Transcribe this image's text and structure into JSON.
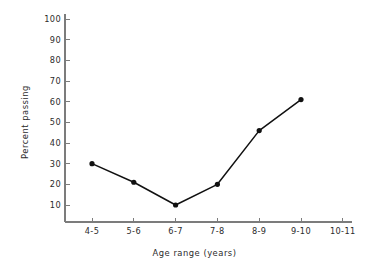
{
  "chart_data": {
    "type": "line",
    "title": "",
    "xlabel": "Age range (years)",
    "ylabel": "Percent passing",
    "categories": [
      "4-5",
      "5-6",
      "6-7",
      "7-8",
      "8-9",
      "9-10",
      "10-11"
    ],
    "values": [
      30,
      21,
      10,
      20,
      46,
      61,
      null
    ],
    "series": [
      {
        "name": "Percent passing",
        "values": [
          30,
          21,
          10,
          20,
          46,
          61,
          null
        ],
        "color": "#111111",
        "marker": "filled-circle"
      }
    ],
    "ylim": [
      0,
      100
    ],
    "y_ticks": [
      10,
      20,
      30,
      40,
      50,
      60,
      70,
      80,
      90,
      100
    ],
    "y_tick_labels": [
      "10",
      "20",
      "30",
      "40",
      "50",
      "60",
      "70",
      "80",
      "90",
      "100"
    ],
    "x_tick_labels": [
      "4-5",
      "5-6",
      "6-7",
      "7-8",
      "8-9",
      "9-10",
      "10-11"
    ],
    "grid": false,
    "legend": null,
    "annotations": [],
    "axis_color": "#7c7c7c",
    "background_color": "#ffffff"
  },
  "labels": {
    "y_axis_title": "Percent passing",
    "x_axis_title": "Age range (years)"
  }
}
